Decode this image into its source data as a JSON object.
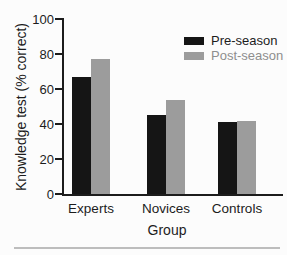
{
  "chart_data": {
    "type": "bar",
    "title": "",
    "xlabel": "Group",
    "ylabel": "Knowledge test (% correct)",
    "categories": [
      "Experts",
      "Novices",
      "Controls"
    ],
    "series": [
      {
        "name": "Pre-season",
        "values": [
          67,
          45,
          41
        ],
        "color": "#151515",
        "label_color": "#1c1c1c"
      },
      {
        "name": "Post-season",
        "values": [
          77,
          54,
          42
        ],
        "color": "#9c9c9c",
        "label_color": "#8e8e8e"
      }
    ],
    "ylim": [
      0,
      100
    ],
    "yticks": [
      0,
      20,
      40,
      60,
      80,
      100
    ],
    "grid": false,
    "legend_position": "top-right"
  },
  "figure": {
    "background": "#fcfcfc",
    "axis_color": "#1c1c1c",
    "bottom_rule_color": "#bdbdbd"
  }
}
